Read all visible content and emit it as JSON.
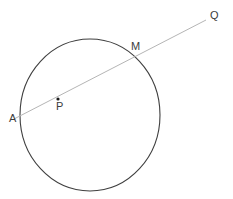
{
  "figure": {
    "background_color": "#ffffff",
    "width": 233,
    "height": 199
  },
  "style": {
    "circle_stroke": "#3f3f3f",
    "circle_stroke_width": 1.1,
    "circle_fill": "none",
    "line_stroke": "#b5b5b5",
    "line_stroke_width": 1.0,
    "center_dot_color": "#1a1a1a",
    "center_dot_radius": 1.6,
    "label_color": "#3c3c3c",
    "label_font_size": 11
  },
  "labels": {
    "a": "A",
    "p": "P",
    "m": "M",
    "q": "Q"
  },
  "chart_data": {
    "type": "scatter",
    "xlabel": "",
    "ylabel": "",
    "xlim": [
      0,
      233
    ],
    "ylim": [
      199,
      0
    ],
    "grid": false,
    "legend": "none",
    "shapes": [
      {
        "name": "circle",
        "type": "ellipse",
        "cx": 90,
        "cy": 115,
        "rx": 70,
        "ry": 76,
        "stroke": "#3f3f3f",
        "fill": "none"
      },
      {
        "name": "secant-line-AQ",
        "type": "line",
        "x1": 14,
        "y1": 119,
        "x2": 206,
        "y2": 20,
        "stroke": "#b5b5b5"
      }
    ],
    "points": [
      {
        "name": "A",
        "label": "A",
        "x": 21,
        "y": 115,
        "marker": "none",
        "note": "left intersection of line with circle"
      },
      {
        "name": "P",
        "label": "P",
        "x": 58,
        "y": 99,
        "marker": "dot",
        "note": "center of circle"
      },
      {
        "name": "M",
        "label": "M",
        "x": 139,
        "y": 56,
        "marker": "none",
        "note": "upper-right intersection of line with circle"
      },
      {
        "name": "Q",
        "label": "Q",
        "x": 206,
        "y": 20,
        "marker": "none",
        "note": "endpoint of ray outside circle"
      }
    ]
  }
}
